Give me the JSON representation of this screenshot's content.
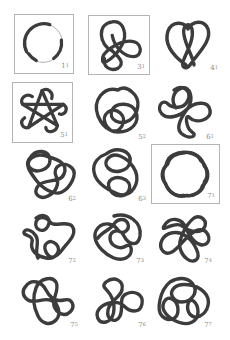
{
  "colors": {
    "strand": "#3c3c3c",
    "box_border": "#b4b4b4",
    "label": "#8a8a8a",
    "background": "#ffffff"
  },
  "knots": [
    {
      "id": "1_1",
      "crossings": "1",
      "index": "1",
      "boxed": true,
      "name": "unknot"
    },
    {
      "id": "3_1",
      "crossings": "3",
      "index": "1",
      "boxed": true,
      "name": "trefoil"
    },
    {
      "id": "4_1",
      "crossings": "4",
      "index": "1",
      "boxed": false,
      "name": "figure-eight"
    },
    {
      "id": "5_1",
      "crossings": "5",
      "index": "1",
      "boxed": true,
      "name": "cinquefoil"
    },
    {
      "id": "5_2",
      "crossings": "5",
      "index": "2",
      "boxed": false,
      "name": "three-twist"
    },
    {
      "id": "6_1",
      "crossings": "6",
      "index": "1",
      "boxed": false,
      "name": "stevedore"
    },
    {
      "id": "6_2",
      "crossings": "6",
      "index": "2",
      "boxed": false,
      "name": "6_2"
    },
    {
      "id": "6_3",
      "crossings": "6",
      "index": "3",
      "boxed": false,
      "name": "6_3"
    },
    {
      "id": "7_1",
      "crossings": "7",
      "index": "1",
      "boxed": true,
      "name": "septafoil"
    },
    {
      "id": "7_2",
      "crossings": "7",
      "index": "2",
      "boxed": false,
      "name": "7_2"
    },
    {
      "id": "7_3",
      "crossings": "7",
      "index": "3",
      "boxed": false,
      "name": "7_3"
    },
    {
      "id": "7_4",
      "crossings": "7",
      "index": "4",
      "boxed": false,
      "name": "7_4"
    },
    {
      "id": "7_5",
      "crossings": "7",
      "index": "5",
      "boxed": false,
      "name": "7_5"
    },
    {
      "id": "7_6",
      "crossings": "7",
      "index": "6",
      "boxed": false,
      "name": "7_6"
    },
    {
      "id": "7_7",
      "crossings": "7",
      "index": "7",
      "boxed": false,
      "name": "7_7"
    }
  ]
}
